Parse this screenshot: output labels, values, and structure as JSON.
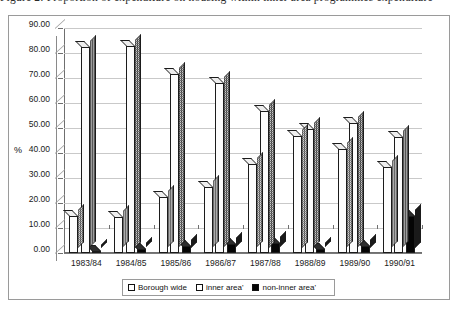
{
  "caption": {
    "text": "Figure 2: Proportion of expenditure on housing within inner area programmes expenditure"
  },
  "chart_data": {
    "type": "bar",
    "title": "",
    "xlabel": "",
    "ylabel": "%",
    "ylim": [
      0,
      90
    ],
    "yticks": [
      "0.00",
      "10.00",
      "20.00",
      "30.00",
      "40.00",
      "50.00",
      "60.00",
      "70.00",
      "80.00",
      "90.00"
    ],
    "ytick_values": [
      0,
      10,
      20,
      30,
      40,
      50,
      60,
      70,
      80,
      90
    ],
    "grid": true,
    "legend_position": "bottom",
    "categories": [
      "1983/84",
      "1984/85",
      "1985/86",
      "1986/87",
      "1987/88",
      "1988/89",
      "1989/90",
      "1990/91"
    ],
    "series": [
      {
        "name": "Borough wide",
        "fill": "white",
        "values": [
          15.0,
          14.5,
          22.5,
          26.5,
          35.5,
          47.0,
          41.5,
          34.5
        ]
      },
      {
        "name": "inner area'",
        "fill": "hatch",
        "values": [
          82.5,
          83.0,
          71.5,
          68.0,
          57.0,
          49.5,
          52.0,
          46.5
        ]
      },
      {
        "name": "non-inner area'",
        "fill": "black",
        "values": [
          1.0,
          1.5,
          3.0,
          3.5,
          4.0,
          1.5,
          3.0,
          15.0
        ]
      }
    ]
  },
  "colors": {
    "frame": "#9a9a9a",
    "axis": "#6f6f6f",
    "grid": "#c9c9c9",
    "bar_outline": "#1b1b1b",
    "series_white": "#fdfdfd",
    "series_hatch": "#fcfcfc",
    "series_black": "#050505"
  }
}
